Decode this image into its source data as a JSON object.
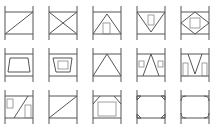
{
  "diagram": {
    "layout": {
      "rows": 3,
      "cols": 5
    },
    "stroke_color": "#555555",
    "background": "#ffffff",
    "panels": [
      {
        "row": 1,
        "col": 1,
        "pattern": "single-diagonal"
      },
      {
        "row": 1,
        "col": 2,
        "pattern": "x-brace"
      },
      {
        "row": 1,
        "col": 3,
        "pattern": "chevron-with-door"
      },
      {
        "row": 1,
        "col": 4,
        "pattern": "inverted-chevron-with-window"
      },
      {
        "row": 1,
        "col": 5,
        "pattern": "diamond-with-opening"
      },
      {
        "row": 2,
        "col": 1,
        "pattern": "trapezoid-opening"
      },
      {
        "row": 2,
        "col": 2,
        "pattern": "offset-trapezoid-opening"
      },
      {
        "row": 2,
        "col": 3,
        "pattern": "chevron"
      },
      {
        "row": 2,
        "col": 4,
        "pattern": "chevron-with-side-windows"
      },
      {
        "row": 2,
        "col": 5,
        "pattern": "inverted-v-with-side-openings"
      },
      {
        "row": 3,
        "col": 1,
        "pattern": "diagonal-with-openings"
      },
      {
        "row": 3,
        "col": 2,
        "pattern": "single-diagonal-long"
      },
      {
        "row": 3,
        "col": 3,
        "pattern": "knee-braced-portal"
      },
      {
        "row": 3,
        "col": 4,
        "pattern": "corner-gussets"
      },
      {
        "row": 3,
        "col": 5,
        "pattern": "rounded-corner-gussets"
      }
    ]
  }
}
